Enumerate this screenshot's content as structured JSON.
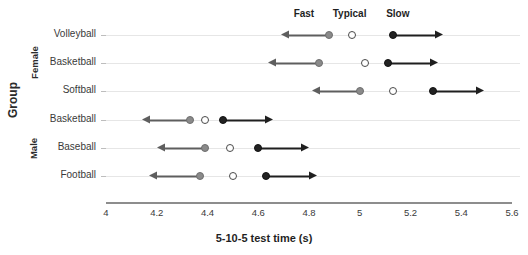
{
  "chart_data": {
    "type": "scatter",
    "title": "",
    "xlabel": "5-10-5 test time (s)",
    "ylabel": "Group",
    "xlim": [
      4,
      5.6
    ],
    "xticks": [
      "4",
      "4.2",
      "4.4",
      "4.6",
      "4.8",
      "5",
      "5.2",
      "5.4",
      "5.6"
    ],
    "xtick_values": [
      4,
      4.2,
      4.4,
      4.6,
      4.8,
      5,
      5.2,
      5.4,
      5.6
    ],
    "grid": true,
    "legend_position": "top",
    "legend": [
      {
        "name": "Fast",
        "marker": "filled-gray-circle",
        "color": "#8a8a8a",
        "x": 4.78
      },
      {
        "name": "Typical",
        "marker": "open-circle",
        "color": "#ffffff",
        "x": 4.96
      },
      {
        "name": "Slow",
        "marker": "filled-black-circle",
        "color": "#222222",
        "x": 5.15
      }
    ],
    "group_labels": [
      {
        "label": "Female",
        "rows": [
          "Volleyball",
          "Basketball",
          "Softball"
        ]
      },
      {
        "label": "Male",
        "rows": [
          "Basketball",
          "Baseball",
          "Football"
        ]
      }
    ],
    "categories": [
      "Volleyball",
      "Basketball",
      "Softball",
      "Basketball",
      "Baseball",
      "Football"
    ],
    "series": [
      {
        "name": "Fast",
        "values": [
          4.88,
          4.84,
          5.0,
          4.33,
          4.39,
          4.37
        ]
      },
      {
        "name": "Typical",
        "values": [
          4.97,
          5.02,
          5.13,
          4.39,
          4.49,
          4.5
        ]
      },
      {
        "name": "Slow",
        "values": [
          5.13,
          5.11,
          5.29,
          4.46,
          4.6,
          4.63
        ]
      }
    ],
    "rows": [
      {
        "category": "Volleyball",
        "group": "Female",
        "fast": 4.88,
        "typical": 4.97,
        "slow": 5.13,
        "fast_arrow_to": 4.69,
        "slow_arrow_to": 5.33
      },
      {
        "category": "Basketball",
        "group": "Female",
        "fast": 4.84,
        "typical": 5.02,
        "slow": 5.11,
        "fast_arrow_to": 4.64,
        "slow_arrow_to": 5.31
      },
      {
        "category": "Softball",
        "group": "Female",
        "fast": 5.0,
        "typical": 5.13,
        "slow": 5.29,
        "fast_arrow_to": 4.81,
        "slow_arrow_to": 5.49
      },
      {
        "category": "Basketball",
        "group": "Male",
        "fast": 4.33,
        "typical": 4.39,
        "slow": 4.46,
        "fast_arrow_to": 4.14,
        "slow_arrow_to": 4.66
      },
      {
        "category": "Baseball",
        "group": "Male",
        "fast": 4.39,
        "typical": 4.49,
        "slow": 4.6,
        "fast_arrow_to": 4.2,
        "slow_arrow_to": 4.8
      },
      {
        "category": "Football",
        "group": "Male",
        "fast": 4.37,
        "typical": 4.5,
        "slow": 4.63,
        "fast_arrow_to": 4.17,
        "slow_arrow_to": 4.83
      }
    ]
  },
  "colors": {
    "fast": "#8a8a8a",
    "typical": "#ffffff",
    "slow": "#222222",
    "grid": "#e6e6e6",
    "axis": "#8d8d8d",
    "text": "#2b2b2b"
  }
}
